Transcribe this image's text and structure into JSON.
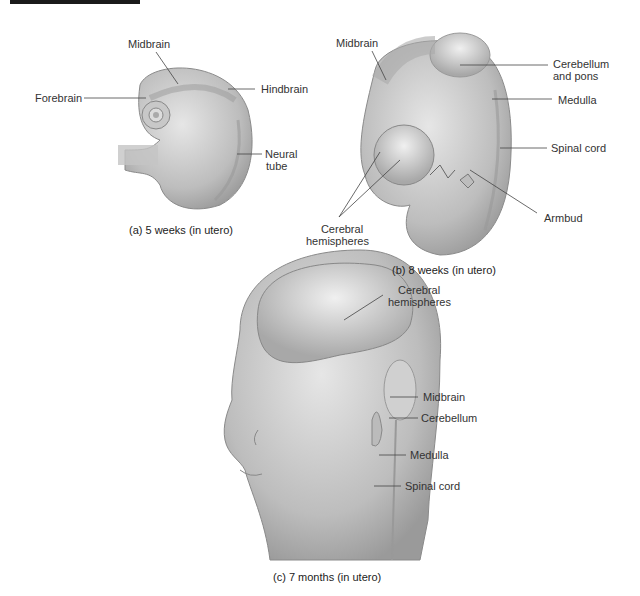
{
  "figure": {
    "panel_a": {
      "caption": "(a) 5 weeks (in utero)",
      "labels": {
        "midbrain": "Midbrain",
        "forebrain": "Forebrain",
        "hindbrain": "Hindbrain",
        "neural_tube_1": "Neural",
        "neural_tube_2": "tube"
      }
    },
    "panel_b": {
      "caption": "(b) 8 weeks (in utero)",
      "labels": {
        "midbrain": "Midbrain",
        "cerebellum_pons_1": "Cerebellum",
        "cerebellum_pons_2": "and pons",
        "medulla": "Medulla",
        "spinal_cord": "Spinal cord",
        "armbud": "Armbud",
        "cerebral_1": "Cerebral",
        "cerebral_2": "hemispheres"
      }
    },
    "panel_c": {
      "caption": "(c) 7 months (in utero)",
      "labels": {
        "cerebral_1": "Cerebral",
        "cerebral_2": "hemispheres",
        "midbrain": "Midbrain",
        "cerebellum": "Cerebellum",
        "medulla": "Medulla",
        "spinal_cord": "Spinal cord"
      }
    }
  }
}
